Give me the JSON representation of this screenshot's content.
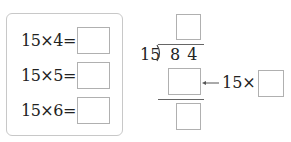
{
  "left_panel": {
    "rows": [
      {
        "expression": "15×4=",
        "answer": ""
      },
      {
        "expression": "15×5=",
        "answer": ""
      },
      {
        "expression": "15×6=",
        "answer": ""
      }
    ]
  },
  "long_division": {
    "divisor": "15",
    "dividend": "8 4",
    "quotient": "",
    "product": "",
    "remainder": "",
    "annotation_prefix": "15×",
    "annotation_multiplier": "",
    "arrow": "←"
  }
}
